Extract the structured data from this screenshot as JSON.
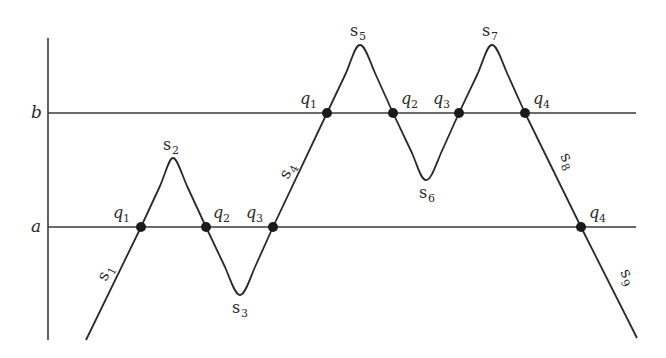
{
  "diagram": {
    "type": "level-crossing diagram",
    "levels": [
      {
        "name": "b",
        "label": "b",
        "y": 113
      },
      {
        "name": "a",
        "label": "a",
        "y": 227
      }
    ],
    "axis": {
      "x": 48,
      "y_top": 38,
      "y_bottom": 340
    },
    "crossings_a": [
      {
        "label": "q",
        "sub": "1",
        "x": 141,
        "y": 227
      },
      {
        "label": "q",
        "sub": "2",
        "x": 206,
        "y": 227
      },
      {
        "label": "q",
        "sub": "3",
        "x": 273,
        "y": 227
      },
      {
        "label": "q",
        "sub": "4",
        "x": 581,
        "y": 227
      }
    ],
    "crossings_b": [
      {
        "label": "q",
        "sub": "1",
        "x": 327,
        "y": 113
      },
      {
        "label": "q",
        "sub": "2",
        "x": 393,
        "y": 113
      },
      {
        "label": "q",
        "sub": "3",
        "x": 459,
        "y": 113
      },
      {
        "label": "q",
        "sub": "4",
        "x": 525,
        "y": 113
      }
    ],
    "segments": [
      {
        "label": "s",
        "sub": "1"
      },
      {
        "label": "s",
        "sub": "2"
      },
      {
        "label": "s",
        "sub": "3"
      },
      {
        "label": "s",
        "sub": "4"
      },
      {
        "label": "s",
        "sub": "5"
      },
      {
        "label": "s",
        "sub": "6"
      },
      {
        "label": "s",
        "sub": "7"
      },
      {
        "label": "s",
        "sub": "8"
      },
      {
        "label": "s",
        "sub": "9"
      }
    ]
  }
}
